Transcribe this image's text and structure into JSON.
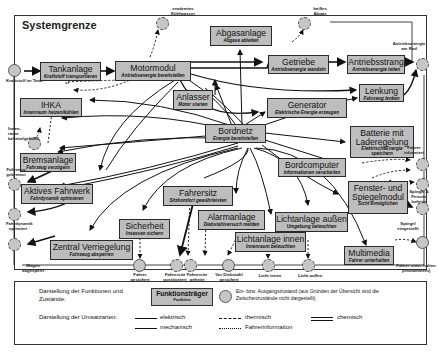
{
  "frame": {
    "title": "Systemgrenze"
  },
  "boxes": {
    "tankanlage": {
      "title": "Tankanlage",
      "function": "Kraftstoff transportieren"
    },
    "motormodul": {
      "title": "Motormodul",
      "function": "Antriebsenergie bereitstellen"
    },
    "abgasanlage": {
      "title": "Abgasanlage",
      "function": "Abgase ableiten"
    },
    "getriebe": {
      "title": "Getriebe",
      "function": "Antriebsenergie wandeln"
    },
    "antriebsstrang": {
      "title": "Antriebsstrang",
      "function": "Antriebsenergie leiten"
    },
    "ihka": {
      "title": "IHKA",
      "function": "Innenraum heizen/kühlen"
    },
    "anlasser": {
      "title": "Anlasser",
      "function": "Motor starten"
    },
    "generator": {
      "title": "Generator",
      "function": "Elektrische Energie erzeugen"
    },
    "lenkung": {
      "title": "Lenkung",
      "function": "Fahrzeug lenken"
    },
    "bordnetz": {
      "title": "Bordnetz",
      "function": "Energie bereitstellen"
    },
    "batterie": {
      "title_line1": "Batterie mit",
      "title_line2": "Laderegelung",
      "function_line1": "ElektrischeEnergie",
      "function_line2": "speichern"
    },
    "bremsanlage": {
      "title": "Bremsanlage",
      "function": "Fahrzeug verzögern"
    },
    "bordcomputer": {
      "title": "Bordcomputer",
      "function": "Informationen verarbeiten"
    },
    "aktives_fahrwerk": {
      "title": "Aktives Fahrwerk",
      "function": "Fahrdynamik optimieren"
    },
    "fahrersitz": {
      "title": "Fahrersitz",
      "function": "Sitzkomfort gewährleisten"
    },
    "fenster_spiegel": {
      "title_line1": "Fenster- und",
      "title_line2": "Spiegelmodul",
      "function": "Sicht ermöglichen"
    },
    "alarmanlage": {
      "title": "Alarmanlage",
      "function": "Diebstahlversuch melden"
    },
    "sicherheit": {
      "title": "Sicherheit",
      "function": "Insassen sichern"
    },
    "lichtanlage_aussen": {
      "title": "Lichtanlage außen",
      "function": "Umgebung beleuchten"
    },
    "lichtanlage_innen": {
      "title": "Lichtanlage innen",
      "function": "Innenraum beleuchten"
    },
    "zentral_verriegelung": {
      "title": "Zentral Verriegelung",
      "function": "Fahrzeug absperren"
    },
    "multimedia": {
      "title": "Multimedia",
      "function": "Fahrer unterhalten"
    }
  },
  "states": {
    "kraftstoff": "Kraftstoff im Tank",
    "kuehlwasser": "erwärmtes Kühlwasser",
    "abgase": "heißes Abgas",
    "antriebsenergie_rad": "Antriebsenergie am Rad",
    "innenraum": "Innen-raum beheizt/gekühlt",
    "fahrzeug_gebremst": "Fahrzeug gebremst",
    "fahrdynamik": "Fahrdynamik optimiert",
    "wagen": "Wagen abgesperrt",
    "fahrer_informiert": "Fahrer informiert",
    "spiegel_fenster": "Spiegel & Fenster beheizt",
    "spiegel_eingestellt": "Spiegel eingestellt",
    "fahrer_unterhalten": "Fahrer unter-halten (Infotainment)",
    "fahrer_gesichert": "Fahrer gesichert",
    "fahrersitz_positioniert": "Fahrersitz positioniert",
    "fahrersitz_geheizt": "Fahrersitz geheizt",
    "diebstahl": "Vor Diebstahl gesichert",
    "licht_innen": "Licht innen",
    "licht_aussen": "Licht außen"
  },
  "legend": {
    "functions_label": "Darstellung der Funktionen und Zustände:",
    "sample_box_title": "Funktionsträger",
    "sample_box_function": "Funktion",
    "state_desc": "Ein- bzw. Ausgangszustand (aus Gründen der Übersicht sind die Zwischenzustände nicht dargestellt)",
    "flows_label": "Darstellung der Umsatzarten:",
    "flows": {
      "elektrisch": "elektrisch",
      "mechanisch": "mechanisch",
      "thermisch": "thermisch",
      "fahrerinformation": "Fahrerinformation",
      "chemisch": "chemisch"
    }
  },
  "colors": {
    "box_fill": "#bdbdbd",
    "state_fill": "#c6c6c6",
    "line": "#111111"
  }
}
